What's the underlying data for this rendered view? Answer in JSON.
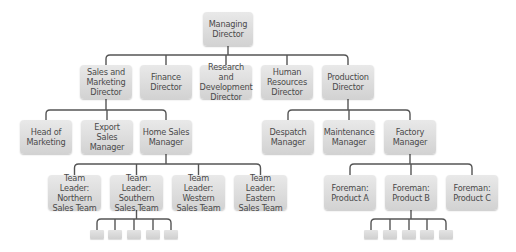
{
  "diagram": {
    "type": "org-chart",
    "line_color": "#555555",
    "box_color": "#dcdcdc",
    "text_color": "#4a4a4a",
    "nodes": [
      {
        "id": "md",
        "label": "Managing Director",
        "lines": [
          "Managing",
          "Director"
        ],
        "x": 203,
        "y": 12,
        "w": 50,
        "h": 34
      },
      {
        "id": "smd",
        "label": "Sales and Marketing Director",
        "lines": [
          "Sales and",
          "Marketing",
          "Director"
        ],
        "x": 80,
        "y": 65,
        "w": 52,
        "h": 34
      },
      {
        "id": "fd",
        "label": "Finance Director",
        "lines": [
          "Finance",
          "Director"
        ],
        "x": 140,
        "y": 65,
        "w": 52,
        "h": 34
      },
      {
        "id": "rdd",
        "label": "Research and Development Director",
        "lines": [
          "Research and",
          "Development",
          "Director"
        ],
        "x": 200,
        "y": 65,
        "w": 52,
        "h": 34
      },
      {
        "id": "hrd",
        "label": "Human Resources Director",
        "lines": [
          "Human",
          "Resources",
          "Director"
        ],
        "x": 261,
        "y": 65,
        "w": 52,
        "h": 34
      },
      {
        "id": "pd",
        "label": "Production Director",
        "lines": [
          "Production",
          "Director"
        ],
        "x": 322,
        "y": 65,
        "w": 52,
        "h": 34
      },
      {
        "id": "hom",
        "label": "Head of Marketing",
        "lines": [
          "Head of",
          "Marketing"
        ],
        "x": 20,
        "y": 120,
        "w": 52,
        "h": 34
      },
      {
        "id": "esm",
        "label": "Export Sales Manager",
        "lines": [
          "Export Sales",
          "Manager"
        ],
        "x": 81,
        "y": 120,
        "w": 52,
        "h": 34
      },
      {
        "id": "hsm",
        "label": "Home Sales Manager",
        "lines": [
          "Home Sales",
          "Manager"
        ],
        "x": 140,
        "y": 120,
        "w": 52,
        "h": 34
      },
      {
        "id": "dm",
        "label": "Despatch Manager",
        "lines": [
          "Despatch",
          "Manager"
        ],
        "x": 262,
        "y": 120,
        "w": 52,
        "h": 34
      },
      {
        "id": "mm",
        "label": "Maintenance Manager",
        "lines": [
          "Maintenance",
          "Manager"
        ],
        "x": 323,
        "y": 120,
        "w": 52,
        "h": 34
      },
      {
        "id": "fm",
        "label": "Factory Manager",
        "lines": [
          "Factory",
          "Manager"
        ],
        "x": 384,
        "y": 120,
        "w": 52,
        "h": 34
      },
      {
        "id": "tln",
        "label": "Team Leader: Northern Sales Team",
        "lines": [
          "Team Leader:",
          "Northern",
          "Sales Team"
        ],
        "x": 48,
        "y": 175,
        "w": 53,
        "h": 35
      },
      {
        "id": "tls",
        "label": "Team Leader: Southern Sales Team",
        "lines": [
          "Team Leader:",
          "Southern",
          "Sales Team"
        ],
        "x": 110,
        "y": 175,
        "w": 53,
        "h": 35
      },
      {
        "id": "tlw",
        "label": "Team Leader: Western Sales Team",
        "lines": [
          "Team Leader:",
          "Western",
          "Sales Team"
        ],
        "x": 172,
        "y": 175,
        "w": 53,
        "h": 35
      },
      {
        "id": "tle",
        "label": "Team Leader: Eastern Sales Team",
        "lines": [
          "Team Leader:",
          "Eastern",
          "Sales Team"
        ],
        "x": 234,
        "y": 175,
        "w": 53,
        "h": 35
      },
      {
        "id": "fpa",
        "label": "Foreman: Product A",
        "lines": [
          "Foreman:",
          "Product A"
        ],
        "x": 324,
        "y": 175,
        "w": 52,
        "h": 35
      },
      {
        "id": "fpb",
        "label": "Foreman: Product B",
        "lines": [
          "Foreman:",
          "Product B"
        ],
        "x": 385,
        "y": 175,
        "w": 52,
        "h": 35
      },
      {
        "id": "fpc",
        "label": "Foreman: Product C",
        "lines": [
          "Foreman:",
          "Product C"
        ],
        "x": 446,
        "y": 175,
        "w": 52,
        "h": 35
      }
    ],
    "edges": [
      {
        "from": "md",
        "to": [
          "smd",
          "fd",
          "rdd",
          "hrd",
          "pd"
        ],
        "bar_y": 55
      },
      {
        "from": "smd",
        "to": [
          "hom",
          "esm",
          "hsm"
        ],
        "bar_y": 110
      },
      {
        "from": "pd",
        "to": [
          "dm",
          "mm",
          "fm"
        ],
        "bar_y": 110
      },
      {
        "from": "hsm",
        "to": [
          "tln",
          "tls",
          "tlw",
          "tle"
        ],
        "bar_y": 164
      },
      {
        "from": "fm",
        "to": [
          "fpa",
          "fpb",
          "fpc"
        ],
        "bar_y": 164
      }
    ],
    "unlabeled_groups": [
      {
        "parent": "tls",
        "count": 5,
        "x": [
          90,
          108,
          127,
          146,
          164
        ],
        "y": 230,
        "w": 14,
        "h": 9,
        "bar_y": 219
      },
      {
        "parent": "fpb",
        "count": 5,
        "x": [
          364,
          383,
          402,
          420,
          439
        ],
        "y": 230,
        "w": 14,
        "h": 9,
        "bar_y": 219
      }
    ]
  }
}
